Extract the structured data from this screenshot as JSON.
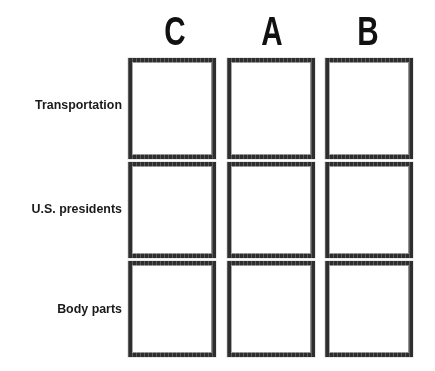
{
  "worksheet": {
    "background_color": "#ffffff",
    "ink_color": "#1a1a1a",
    "rule_color": "#2e2e2e"
  },
  "grid": {
    "column_headers": [
      {
        "label": "C"
      },
      {
        "label": "A"
      },
      {
        "label": "B"
      }
    ],
    "row_labels": [
      {
        "label": "Transportation"
      },
      {
        "label": "U.S. presidents"
      },
      {
        "label": "Body parts"
      }
    ],
    "cells": [
      [
        {
          "value": ""
        },
        {
          "value": ""
        },
        {
          "value": ""
        }
      ],
      [
        {
          "value": ""
        },
        {
          "value": ""
        },
        {
          "value": ""
        }
      ],
      [
        {
          "value": ""
        },
        {
          "value": ""
        },
        {
          "value": ""
        }
      ]
    ]
  }
}
